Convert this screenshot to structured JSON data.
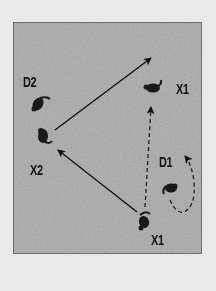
{
  "diagram": {
    "background_color": "#e9e9e9",
    "panel_color": "#a9a9a9",
    "ink_color": "#111111",
    "labels": [
      {
        "id": "d2",
        "text": "D2",
        "x": 23,
        "y": 75
      },
      {
        "id": "x2",
        "text": "X2",
        "x": 30,
        "y": 163
      },
      {
        "id": "x1-top",
        "text": "X1",
        "x": 176,
        "y": 82
      },
      {
        "id": "d1",
        "text": "D1",
        "x": 159,
        "y": 155
      },
      {
        "id": "x1-bottom",
        "text": "X1",
        "x": 151,
        "y": 233
      }
    ],
    "players": [
      {
        "id": "d2",
        "role": "defender",
        "x": 44,
        "y": 104
      },
      {
        "id": "x2",
        "role": "attacker",
        "x": 42,
        "y": 135
      },
      {
        "id": "x1-top",
        "role": "attacker",
        "x": 154,
        "y": 88
      },
      {
        "id": "d1",
        "role": "defender",
        "x": 172,
        "y": 187
      },
      {
        "id": "x1-bottom",
        "role": "attacker",
        "x": 145,
        "y": 222
      }
    ],
    "arrows": [
      {
        "id": "pass-x2-to-x1",
        "style": "solid",
        "from": [
          55,
          130
        ],
        "to": [
          151,
          58
        ]
      },
      {
        "id": "pass-x1-to-x2",
        "style": "solid",
        "from": [
          137,
          212
        ],
        "to": [
          58,
          150
        ]
      },
      {
        "id": "run-x1-up",
        "style": "dashed",
        "from": [
          145,
          207
        ],
        "to": [
          151,
          107
        ]
      },
      {
        "id": "run-d1-curve",
        "style": "dashed-curve",
        "from": [
          170,
          200
        ],
        "to": [
          185,
          155
        ]
      }
    ]
  }
}
